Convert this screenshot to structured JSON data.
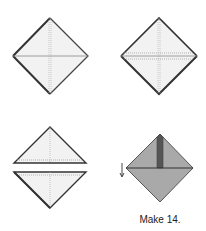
{
  "figure": {
    "caption": "Make 14.",
    "steps": [
      {
        "id": 1,
        "description": "square on point with center creases"
      },
      {
        "id": 2,
        "description": "square on point with horizontal seam lines marked"
      },
      {
        "id": 3,
        "description": "square cut into two triangles"
      },
      {
        "id": 4,
        "description": "shaded unit with strip and fold arrow"
      }
    ],
    "colors": {
      "paper": "#f2f2f2",
      "edge": "#333333",
      "crease": "#9a9a9a",
      "shaded": "#a9a9a9",
      "strip": "#555555"
    }
  }
}
